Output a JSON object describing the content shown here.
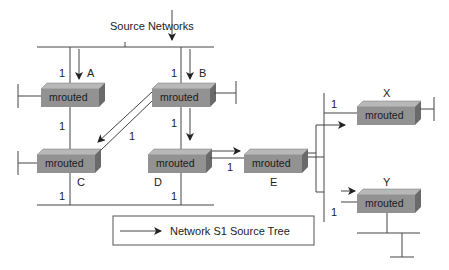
{
  "title": "Network S1 Source Tree",
  "source_label": "Source Networks",
  "router_label": "mrouted",
  "routers": [
    {
      "id": "A",
      "label": "A",
      "metric_in": "1",
      "metric_out": "1"
    },
    {
      "id": "B",
      "label": "B",
      "metric_in": "1",
      "metric_out": "1",
      "metric_diag": "1"
    },
    {
      "id": "C",
      "label": "C",
      "metric_bottom": "1"
    },
    {
      "id": "D",
      "label": "D",
      "metric_bottom": "1",
      "metric_right": "1"
    },
    {
      "id": "E",
      "label": "E"
    },
    {
      "id": "X",
      "label": "X",
      "metric": "1"
    },
    {
      "id": "Y",
      "label": "Y",
      "metric": "1"
    }
  ],
  "legend": {
    "label": "Network S1 Source Tree"
  },
  "colors": {
    "router_front": "#8f8f8f",
    "router_top": "#b5b5b5",
    "router_side": "#6e6e6e",
    "line": "#444444"
  }
}
